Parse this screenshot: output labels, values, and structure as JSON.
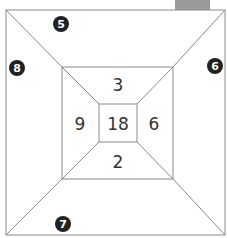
{
  "diagram": {
    "inner_numbers": {
      "center": "18",
      "top": "3",
      "left": "9",
      "right": "6",
      "bottom": "2"
    },
    "outer_badges": {
      "top": "5",
      "left": "8",
      "right": "6",
      "bottom": "7"
    },
    "colors": {
      "line": "#8a8a8a",
      "badge": "#222222",
      "text": "#333333"
    }
  }
}
